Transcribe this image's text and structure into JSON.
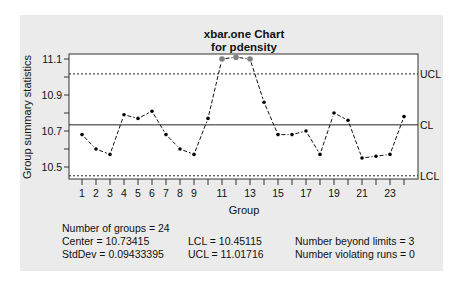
{
  "chart_data": {
    "type": "line",
    "title": "xbar.one Chart",
    "subtitle": "for pdensity",
    "xlabel": "Group",
    "ylabel": "Group summary statistics",
    "x": [
      1,
      2,
      3,
      4,
      5,
      6,
      7,
      8,
      9,
      10,
      11,
      12,
      13,
      14,
      15,
      16,
      17,
      18,
      19,
      20,
      21,
      22,
      23,
      24
    ],
    "values": [
      10.68,
      10.6,
      10.57,
      10.79,
      10.77,
      10.81,
      10.68,
      10.6,
      10.57,
      10.77,
      11.1,
      11.11,
      11.1,
      10.86,
      10.68,
      10.68,
      10.7,
      10.57,
      10.8,
      10.76,
      10.55,
      10.56,
      10.57,
      10.78
    ],
    "beyond_limits_indices": [
      11,
      12,
      13
    ],
    "x_tick_labels": [
      "1",
      "2",
      "3",
      "4",
      "5",
      "6",
      "7",
      "8",
      "9",
      "11",
      "13",
      "15",
      "17",
      "19",
      "21",
      "23"
    ],
    "y_ticks": [
      10.5,
      10.7,
      10.9,
      11.1
    ],
    "y_tick_labels": [
      "10.5",
      "10.7",
      "10.9",
      "11.1"
    ],
    "ylim": [
      10.43,
      11.13
    ],
    "xlim": [
      0,
      25
    ],
    "control_lines": [
      {
        "label": "UCL",
        "value": 11.01716,
        "style": "dashed"
      },
      {
        "label": "CL",
        "value": 10.73415,
        "style": "solid"
      },
      {
        "label": "LCL",
        "value": 10.45115,
        "style": "dashed"
      }
    ],
    "grid": false,
    "colors": {
      "point": "#000000",
      "violation_point": "#808080",
      "panel_bg": "#ebebeb",
      "plot_bg": "#ffffff"
    }
  },
  "stats": {
    "groups": "Number of groups = 24",
    "center": "Center = 10.73415",
    "stddev": "StdDev = 0.09433395",
    "lcl": "LCL = 10.45115",
    "ucl": "UCL = 11.01716",
    "beyond": "Number beyond limits = 3",
    "runs": "Number violating runs = 0"
  }
}
